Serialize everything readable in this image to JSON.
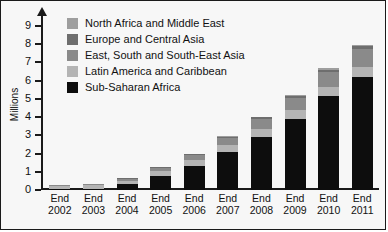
{
  "chart_data": {
    "type": "bar",
    "stacked": true,
    "title": "",
    "xlabel": "",
    "ylabel": "Millions",
    "ylim": [
      0,
      9.6
    ],
    "yticks": [
      0,
      1,
      2,
      3,
      4,
      5,
      6,
      7,
      8,
      9
    ],
    "ytick_labels": [
      "0",
      "1",
      "2",
      "3",
      "4",
      "5",
      "6",
      "7",
      "8",
      "9"
    ],
    "grid": false,
    "legend_position": "upper-left-inside",
    "categories": [
      "End 2002",
      "End 2003",
      "End 2004",
      "End 2005",
      "End 2006",
      "End 2007",
      "End 2008",
      "End 2009",
      "End 2010",
      "End 2011"
    ],
    "category_lines": [
      [
        "End",
        "2002"
      ],
      [
        "End",
        "2003"
      ],
      [
        "End",
        "2004"
      ],
      [
        "End",
        "2005"
      ],
      [
        "End",
        "2006"
      ],
      [
        "End",
        "2007"
      ],
      [
        "End",
        "2008"
      ],
      [
        "End",
        "2009"
      ],
      [
        "End",
        "2010"
      ],
      [
        "End",
        "2011"
      ]
    ],
    "series": [
      {
        "name": "Sub-Saharan Africa",
        "color": "#0d0d0d",
        "values": [
          0.05,
          0.07,
          0.31,
          0.78,
          1.33,
          2.1,
          2.93,
          3.89,
          5.13,
          6.19
        ]
      },
      {
        "name": "Latin America and Caribbean",
        "color": "#b4b4b4",
        "values": [
          0.17,
          0.18,
          0.21,
          0.26,
          0.31,
          0.37,
          0.43,
          0.48,
          0.52,
          0.56
        ]
      },
      {
        "name": "East, South and South-East Asia",
        "color": "#8a8a8a",
        "values": [
          0.05,
          0.06,
          0.1,
          0.18,
          0.28,
          0.39,
          0.54,
          0.7,
          0.82,
          0.96
        ]
      },
      {
        "name": "Europe and Central Asia",
        "color": "#6e6e6e",
        "values": [
          0.01,
          0.01,
          0.02,
          0.03,
          0.05,
          0.06,
          0.08,
          0.1,
          0.14,
          0.19
        ]
      },
      {
        "name": "North Africa and Middle East",
        "color": "#9e9e9e",
        "values": [
          0.01,
          0.01,
          0.01,
          0.02,
          0.02,
          0.03,
          0.04,
          0.05,
          0.06,
          0.08
        ]
      }
    ],
    "totals": [
      0.29,
      0.33,
      0.65,
      1.27,
      1.99,
      2.95,
      4.02,
      5.22,
      6.67,
      7.98
    ],
    "legend_entries": [
      "North Africa and Middle East",
      "Europe and Central Asia",
      "East, South and South-East Asia",
      "Latin America and Caribbean",
      "Sub-Saharan Africa"
    ],
    "legend_colors": [
      "#9e9e9e",
      "#6e6e6e",
      "#8a8a8a",
      "#b4b4b4",
      "#0d0d0d"
    ]
  },
  "colors": {
    "background": "#f7f7f7",
    "axis": "#1a1a1a",
    "text": "#111111"
  }
}
